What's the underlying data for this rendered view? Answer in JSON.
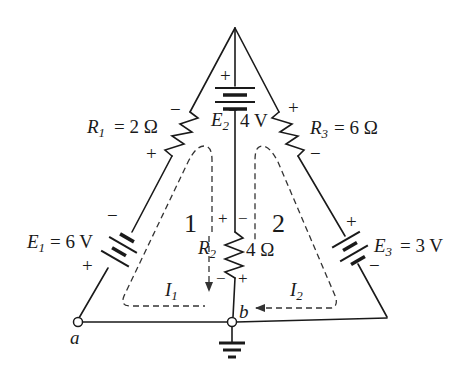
{
  "diagram": {
    "type": "circuit",
    "components": {
      "R1": {
        "name": "R",
        "sub": "1",
        "value": "= 2 Ω",
        "polarity_top": "−",
        "polarity_bottom": "+"
      },
      "R2": {
        "name": "R",
        "sub": "2",
        "value": "4 Ω",
        "polarity_left_top": "+",
        "polarity_right_top": "−",
        "polarity_left_bottom": "−",
        "polarity_right_bottom": "+"
      },
      "R3": {
        "name": "R",
        "sub": "3",
        "value": "= 6 Ω",
        "polarity_top": "+",
        "polarity_bottom": "−"
      },
      "E1": {
        "name": "E",
        "sub": "1",
        "value": "= 6 V",
        "polarity_top": "−",
        "polarity_bottom": "+"
      },
      "E2": {
        "name": "E",
        "sub": "2",
        "value": "4 V",
        "polarity_top": "+",
        "polarity_bottom": "−"
      },
      "E3": {
        "name": "E",
        "sub": "3",
        "value": "= 3 V",
        "polarity_top": "+",
        "polarity_bottom": "−"
      }
    },
    "loops": [
      {
        "number": "1",
        "current": "I",
        "sub": "1"
      },
      {
        "number": "2",
        "current": "I",
        "sub": "2"
      }
    ],
    "nodes": {
      "a": "a",
      "b": "b"
    },
    "colors": {
      "wire": "#1a1a1a",
      "dash": "#333333",
      "background": "#ffffff"
    }
  }
}
